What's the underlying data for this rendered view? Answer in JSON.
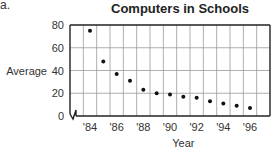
{
  "figure_label": "a.",
  "chart_data": {
    "type": "scatter",
    "title": "Computers in Schools",
    "xlabel": "Year",
    "ylabel": "Average",
    "x": [
      "'84",
      "'85",
      "'86",
      "'87",
      "'88",
      "'89",
      "'90",
      "'91",
      "'92",
      "'93",
      "'94",
      "'95",
      "'96"
    ],
    "values": [
      75,
      48,
      37,
      31,
      23,
      20,
      19,
      17,
      16,
      13,
      11,
      9,
      7
    ],
    "x_tick_labels": [
      "'84",
      "'86",
      "'88",
      "'90",
      "'92",
      "'94",
      "'96"
    ],
    "y_tick_labels": [
      "0",
      "20",
      "40",
      "60",
      "80"
    ],
    "ylim": [
      0,
      80
    ],
    "grid": true,
    "axis_break": "y-axis break symbol at origin",
    "legend": null
  }
}
